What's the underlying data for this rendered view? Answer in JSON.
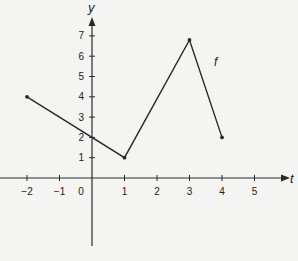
{
  "chart_data": {
    "type": "line",
    "title": "",
    "xlabel": "t",
    "ylabel": "y",
    "series": [
      {
        "name": "f",
        "points": [
          [
            -2,
            4
          ],
          [
            1,
            1
          ],
          [
            3,
            6.8
          ],
          [
            4,
            2
          ]
        ]
      }
    ],
    "x_ticks": [
      -2,
      -1,
      0,
      1,
      2,
      3,
      4,
      5
    ],
    "y_ticks": [
      1,
      2,
      3,
      4,
      5,
      6,
      7
    ],
    "x_tick_labels": [
      "−2",
      "−1",
      "0",
      "1",
      "2",
      "3",
      "4",
      "5"
    ],
    "y_tick_labels": [
      "1",
      "2",
      "3",
      "4",
      "5",
      "6",
      "7"
    ],
    "xlim": [
      -2.9,
      6.3
    ],
    "ylim": [
      -4.5,
      8.5
    ],
    "grid": false,
    "curve_label": "f"
  },
  "colors": {
    "line": "#2a2a2a",
    "background": "#f4f4f2"
  }
}
